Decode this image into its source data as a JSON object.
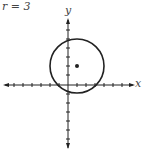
{
  "title": "r = 3",
  "axes": {
    "x_label": "x",
    "y_label": "y"
  },
  "circle": {
    "center": [
      1,
      2
    ],
    "radius": 3
  },
  "colors": {
    "stroke": "#222222",
    "text": "#444444"
  }
}
